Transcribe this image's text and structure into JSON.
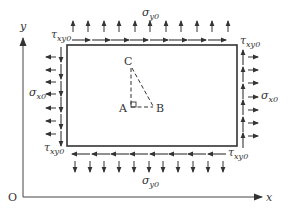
{
  "diagram": {
    "colors": {
      "stroke": "#333333",
      "background": "#ffffff"
    },
    "axes": {
      "origin_label": "O",
      "x_label": "x",
      "y_label": "y"
    },
    "plate": {
      "x": 67,
      "y": 45,
      "width": 170,
      "height": 101
    },
    "stress_labels": {
      "sigma_y_top": {
        "symbol": "σ",
        "sub": "y0"
      },
      "sigma_y_bottom": {
        "symbol": "σ",
        "sub": "y0"
      },
      "sigma_x_left": {
        "symbol": "σ",
        "sub": "x0"
      },
      "sigma_x_right": {
        "symbol": "σ",
        "sub": "x0"
      },
      "tau_top_left": {
        "symbol": "τ",
        "sub": "xy0"
      },
      "tau_top_right": {
        "symbol": "τ",
        "sub": "xy0"
      },
      "tau_bottom_left": {
        "symbol": "τ",
        "sub": "xy0"
      },
      "tau_bottom_right": {
        "symbol": "τ",
        "sub": "xy0"
      }
    },
    "triangle": {
      "points": {
        "A": "A",
        "B": "B",
        "C": "C"
      },
      "right_angle_at": "A",
      "line_style": "dashed"
    },
    "arrow_counts": {
      "top_normal_up": 11,
      "top_shear_right": 8,
      "bottom_normal_down": 11,
      "bottom_shear_left": 8,
      "left_normal_left": 7,
      "left_shear_down": 6,
      "right_normal_right": 7,
      "right_shear_up": 6
    }
  }
}
